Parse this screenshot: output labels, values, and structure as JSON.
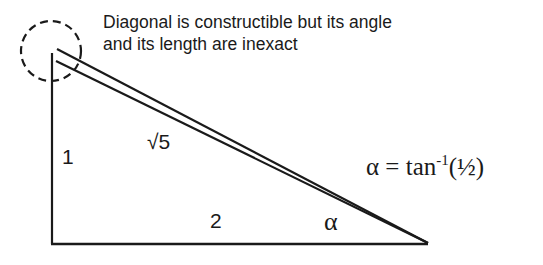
{
  "caption": {
    "line1": "Diagonal is constructible but its angle",
    "line2": "and its length are inexact"
  },
  "labels": {
    "vertical_side": "1",
    "hypotenuse": "√5",
    "base": "2",
    "angle": "α"
  },
  "formula": {
    "lhs": "α = tan",
    "exponent": "-1",
    "argument": "(½)"
  },
  "colors": {
    "stroke": "#1a1a1a",
    "background": "#ffffff"
  }
}
